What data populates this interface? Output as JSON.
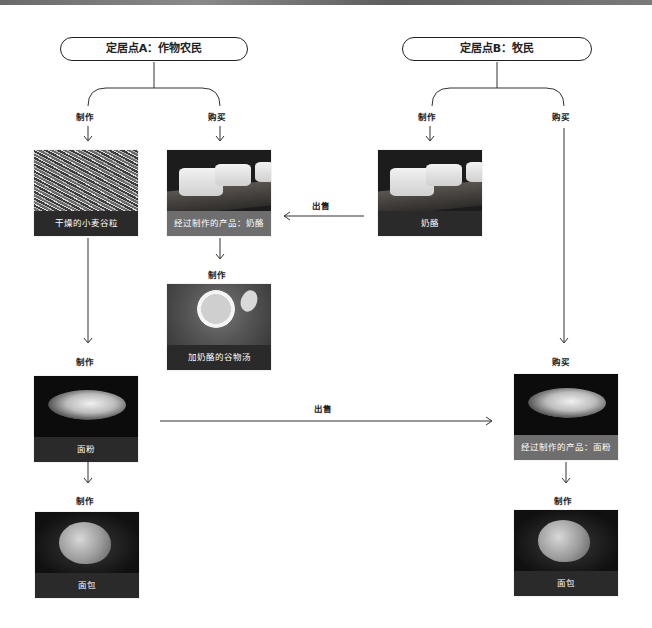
{
  "diagram": {
    "settlement_a": {
      "title": "定居点A：作物农民"
    },
    "settlement_b": {
      "title": "定居点B：牧民"
    },
    "labels": {
      "a_make": "制作",
      "a_buy": "购买",
      "b_make": "制作",
      "b_buy": "购买",
      "sell_cheese": "出售",
      "make_soup": "制作",
      "make_flour": "制作",
      "sell_flour": "出售",
      "buy_flour": "购买",
      "make_bread_a": "制作",
      "make_bread_b": "制作"
    },
    "cards": {
      "wheat": "干燥的小麦谷粒",
      "cheese_product": "经过制作的产品：奶酪",
      "cheese": "奶酪",
      "soup": "加奶酪的谷物汤",
      "flour": "面粉",
      "flour_product": "经过制作的产品：面粉",
      "bread_a": "面包",
      "bread_b": "面包"
    },
    "icons": {
      "image_wheat": "dried-wheat-grain-photo",
      "image_cheese": "cheese-wheels-photo",
      "image_soup": "cheese-grain-soup-photo",
      "image_flour": "flour-heap-photo",
      "image_bread": "bread-loaf-photo"
    },
    "colors": {
      "caption_dark": "#2a2a2a",
      "caption_product": "#6e6e6e",
      "line": "#222222"
    }
  }
}
